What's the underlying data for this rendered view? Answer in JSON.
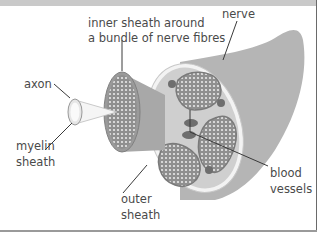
{
  "diagram": {
    "labels": {
      "inner_sheath_line1": "inner sheath around",
      "inner_sheath_line2": "a bundle of nerve fibres",
      "nerve": "nerve",
      "axon": "axon",
      "myelin_line1": "myelin",
      "myelin_line2": "sheath",
      "outer_line1": "outer",
      "outer_line2": "sheath",
      "blood_line1": "blood",
      "blood_line2": "vessels"
    },
    "colors": {
      "nerve_body": "#b5b5b5",
      "bundle_fill": "#8f8f8f",
      "dots": "#e8e8e8",
      "vessel": "#6e6e6e",
      "outer_sheath": "#f3f3f3",
      "text": "#4a4a4a",
      "leader_line": "#3a3a3a"
    }
  }
}
